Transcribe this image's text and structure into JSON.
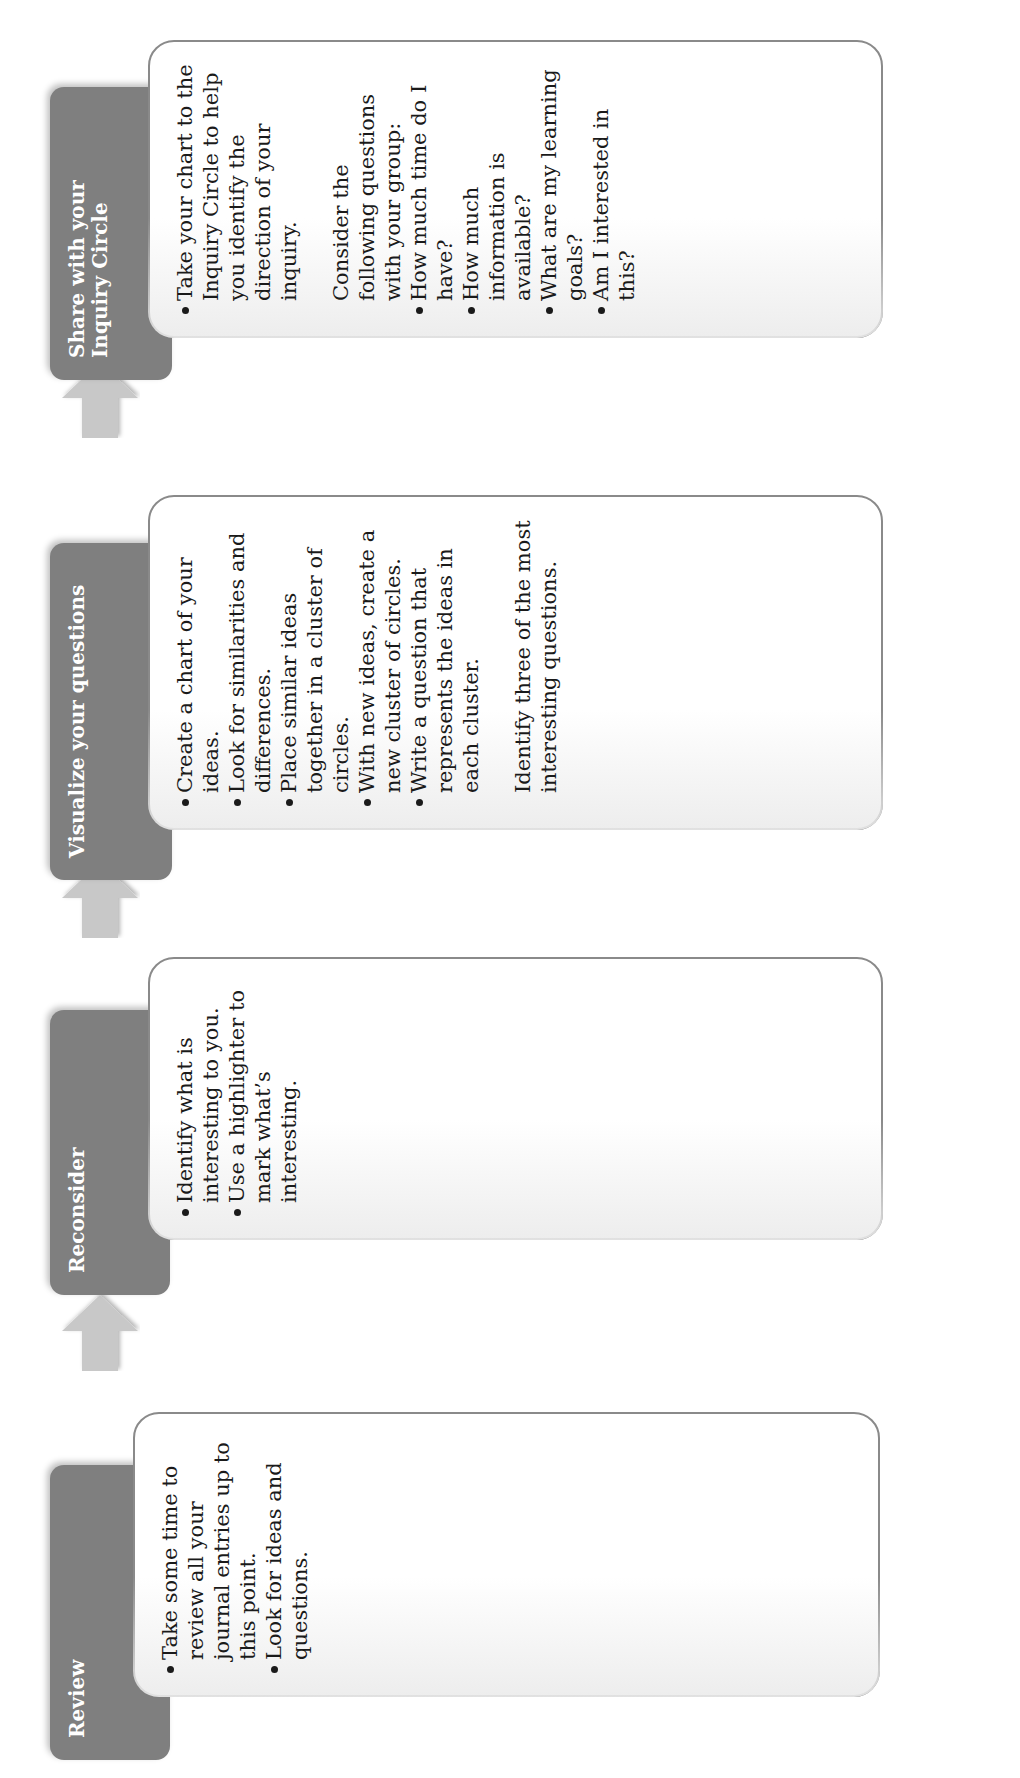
{
  "diagram": {
    "steps": [
      {
        "title": "Review",
        "bullets": [
          "Take some time  to review all your journal entries up to this point.",
          "Look for ideas and questions."
        ]
      },
      {
        "title": "Reconsider",
        "bullets": [
          "Identify what is interesting  to you.",
          "Use a highlighter to mark what’s interesting."
        ]
      },
      {
        "title": "Visualize your questions",
        "bullets": [
          "Create a chart of  your ideas.",
          "Look for similarities and differences.",
          "Place similar ideas  together in a cluster of circles.",
          "With new ideas, create a new cluster of circles.",
          "Write a question that represents the ideas in each cluster."
        ],
        "note": "Identify three of the most interesting questions."
      },
      {
        "title": "Share with your Inquiry Circle",
        "bullets": [
          "Take your chart to the Inquiry Circle to help you identify the direction of your inquiry."
        ],
        "note": "Consider the following questions with your group:",
        "sub_bullets": [
          "How much time do I have?",
          "How much information is available?",
          "What are my learning goals?",
          "Am I interested in this?"
        ]
      }
    ],
    "arrows": [
      "arrow-right",
      "arrow-right",
      "arrow-right"
    ],
    "colors": {
      "tab": "#7f7f7f",
      "tab_text": "#ffffff",
      "box_border": "#8a8a8a",
      "arrow": "#c8c8c8"
    }
  }
}
